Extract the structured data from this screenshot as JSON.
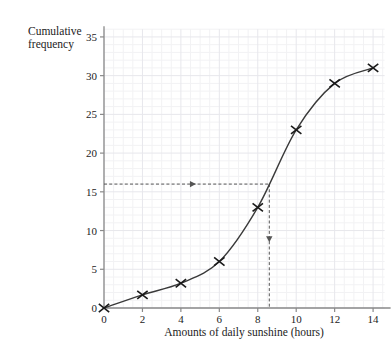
{
  "chart_data": {
    "type": "line",
    "title": "",
    "subtitle": "",
    "xlabel": "Amounts of daily sunshine (hours)",
    "ylabel": "Cumulative frequency",
    "ylabel_line1": "Cumulative",
    "ylabel_line2": "frequency",
    "grid": true,
    "legend": "none",
    "xlim": [
      0,
      14.6
    ],
    "ylim": [
      0,
      36
    ],
    "xticks": [
      0,
      2,
      4,
      6,
      8,
      10,
      12,
      14
    ],
    "xtick_labels": [
      "0",
      "2",
      "4",
      "6",
      "8",
      "10",
      "12",
      "14"
    ],
    "yticks": [
      0,
      5,
      10,
      15,
      20,
      25,
      30,
      35
    ],
    "ytick_labels": [
      "0",
      "5",
      "10",
      "15",
      "20",
      "25",
      "30",
      "35"
    ],
    "x": [
      0,
      2,
      4,
      6,
      8,
      10,
      12,
      14
    ],
    "values": [
      0,
      1.7,
      3.2,
      6,
      13,
      23,
      29,
      31
    ],
    "marker": "x-cross",
    "series": [
      {
        "name": "Cumulative frequency",
        "x": [
          0,
          2,
          4,
          6,
          8,
          10,
          12,
          14
        ],
        "values": [
          0,
          1.7,
          3.2,
          6,
          13,
          23,
          29,
          31
        ]
      }
    ],
    "annotations": [
      {
        "name": "median-readoff",
        "type": "dashed-guide",
        "y_value": 16,
        "x_value": 8.6,
        "horizontal_from_x": 0,
        "horizontal_to_x": 8.6,
        "vertical_from_y": 16,
        "vertical_to_y": 0,
        "arrow_horizontal": "right",
        "arrow_vertical": "down"
      }
    ],
    "colors": {
      "curve": "#3a3a3a",
      "axis": "#8a8a8a",
      "grid_minor": "#f2f2f4",
      "grid_major": "#e7e7ec",
      "marker": "#1a1a1a",
      "dashed": "#555555",
      "text": "#1c1c1c",
      "background": "#ffffff"
    }
  }
}
